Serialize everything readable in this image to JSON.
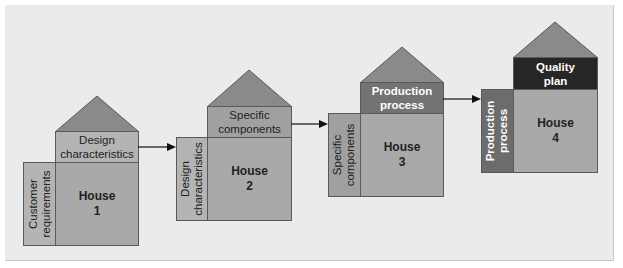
{
  "colors": {
    "background": "#ebebeb",
    "roof": "#8a8a8a",
    "light_panel": "#b4b4b4",
    "body": "#a9a9a9",
    "medium_panel": "#737373",
    "dark_panel": "#262626",
    "border": "#5a5a5a"
  },
  "houses": [
    {
      "name": "House",
      "number": "1",
      "top_label": "Design characteristics",
      "top_line1": "Design",
      "top_line2": "characteristics",
      "side_label": "Customer requirements",
      "side_line1": "Customer",
      "side_line2": "requirements"
    },
    {
      "name": "House",
      "number": "2",
      "top_label": "Specific components",
      "top_line1": "Specific",
      "top_line2": "components",
      "side_label": "Design characteristics",
      "side_line1": "Design",
      "side_line2": "characteristics"
    },
    {
      "name": "House",
      "number": "3",
      "top_label": "Production process",
      "top_line1": "Production",
      "top_line2": "process",
      "side_label": "Specific components",
      "side_line1": "Specific",
      "side_line2": "components"
    },
    {
      "name": "House",
      "number": "4",
      "top_label": "Quality plan",
      "top_line1": "Quality",
      "top_line2": "plan",
      "side_label": "Production process",
      "side_line1": "Production",
      "side_line2": "process"
    }
  ],
  "arrows": [
    {
      "from": "House 1",
      "to": "House 2"
    },
    {
      "from": "House 2",
      "to": "House 3"
    },
    {
      "from": "House 3",
      "to": "House 4"
    }
  ]
}
